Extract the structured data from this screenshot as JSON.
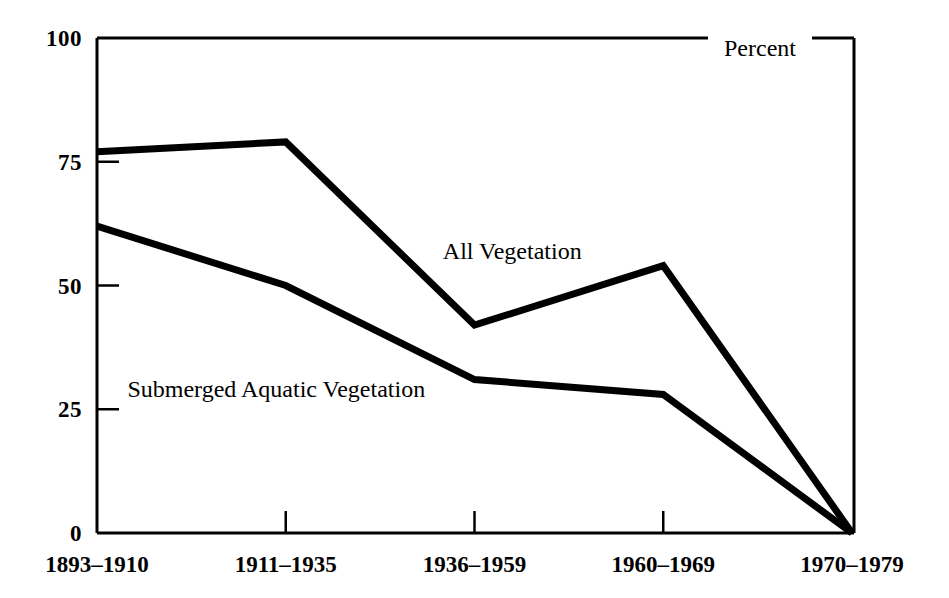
{
  "chart_data": {
    "type": "line",
    "title": "",
    "subtitle": "",
    "xlabel": "",
    "ylabel": "Percent",
    "unit_label": "Percent",
    "categories": [
      "1893–1910",
      "1911–1935",
      "1936–1959",
      "1960–1969",
      "1970–1979"
    ],
    "x": [
      0,
      1,
      2,
      3,
      4
    ],
    "ylim": [
      0,
      100
    ],
    "yticks": [
      0,
      25,
      50,
      75,
      100
    ],
    "ytick_labels": [
      "0",
      "25",
      "50",
      "75",
      "100"
    ],
    "grid": false,
    "legend": "inline-annotations",
    "series": [
      {
        "name": "All Vegetation",
        "values": [
          77,
          79,
          42,
          54,
          0
        ],
        "color": "#000000",
        "label_x_category_index": 2.2,
        "label_value": 57
      },
      {
        "name": "Submerged Aquatic Vegetation",
        "values": [
          62,
          50,
          31,
          28,
          0
        ],
        "color": "#000000",
        "label_x_category_index": 0.95,
        "label_value": 29
      }
    ],
    "annotations": [
      {
        "text": "Percent",
        "position": "top-right"
      },
      {
        "text": "All Vegetation",
        "position": "inline"
      },
      {
        "text": "Submerged Aquatic Vegetation",
        "position": "inline"
      }
    ],
    "colors": {
      "line": "#000000",
      "axis": "#000000",
      "background": "#ffffff",
      "text": "#000000"
    }
  }
}
